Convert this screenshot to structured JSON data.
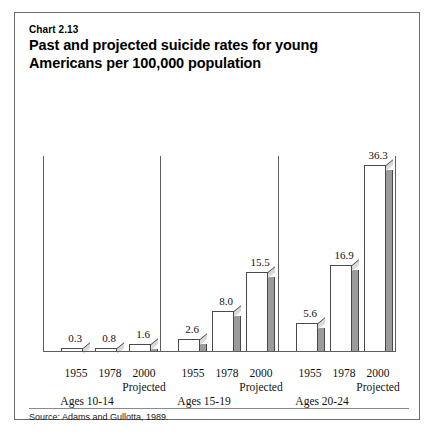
{
  "figure": {
    "chart_number": "Chart 2.13",
    "title": "Past and projected suicide rates for young Americans per 100,000 population",
    "title_line1": "Past and projected suicide rates for young",
    "title_line2": "Americans per 100,000 population",
    "source": "Source: Adams and Gullotta, 1989.",
    "border_color": "#6e6e6e",
    "bar_face_color": "#ffffff",
    "bar_side_color": "#9b9b9b",
    "bar_outline_color": "#4a4a4a"
  },
  "chart_data": {
    "type": "bar",
    "title": "Past and projected suicide rates for young Americans per 100,000 population",
    "subtitle": "Chart 2.13",
    "xlabel": "",
    "ylabel": "",
    "ylim": [
      0,
      38
    ],
    "grid": false,
    "legend": "none",
    "source": "Adams and Gullotta, 1989.",
    "groups": [
      "Ages 10-14",
      "Ages 15-19",
      "Ages 20-24"
    ],
    "categories": [
      "1955",
      "1978",
      "2000 Projected"
    ],
    "series": [
      {
        "name": "Ages 10-14",
        "values": [
          0.3,
          0.8,
          1.6
        ]
      },
      {
        "name": "Ages 15-19",
        "values": [
          2.6,
          8.0,
          15.5
        ]
      },
      {
        "name": "Ages 20-24",
        "values": [
          5.6,
          16.9,
          36.3
        ]
      }
    ],
    "bars": [
      {
        "group": "Ages 10-14",
        "year": "1955",
        "projected": false,
        "value": 0.3,
        "label": "0.3"
      },
      {
        "group": "Ages 10-14",
        "year": "1978",
        "projected": false,
        "value": 0.8,
        "label": "0.8"
      },
      {
        "group": "Ages 10-14",
        "year": "2000",
        "projected": true,
        "value": 1.6,
        "label": "1.6"
      },
      {
        "group": "Ages 15-19",
        "year": "1955",
        "projected": false,
        "value": 2.6,
        "label": "2.6"
      },
      {
        "group": "Ages 15-19",
        "year": "1978",
        "projected": false,
        "value": 8.0,
        "label": "8.0"
      },
      {
        "group": "Ages 15-19",
        "year": "2000",
        "projected": true,
        "value": 15.5,
        "label": "15.5"
      },
      {
        "group": "Ages 20-24",
        "year": "1955",
        "projected": false,
        "value": 5.6,
        "label": "5.6"
      },
      {
        "group": "Ages 20-24",
        "year": "1978",
        "projected": false,
        "value": 16.9,
        "label": "16.9"
      },
      {
        "group": "Ages 20-24",
        "year": "2000",
        "projected": true,
        "value": 36.3,
        "label": "36.3"
      }
    ],
    "tick_labels": {
      "years": [
        "1955",
        "1978",
        "2000",
        "1955",
        "1978",
        "2000",
        "1955",
        "1978",
        "2000"
      ],
      "projected_note": "Projected"
    }
  }
}
